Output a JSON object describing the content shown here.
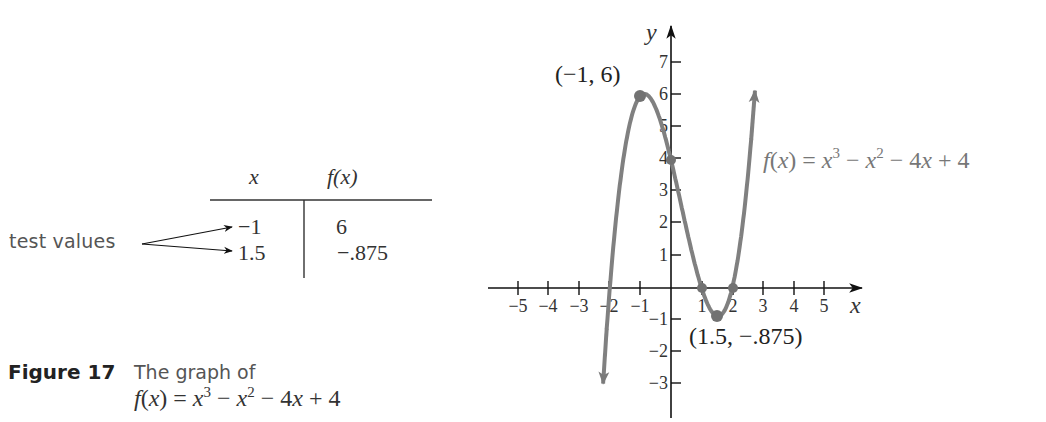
{
  "table": {
    "header_x": "x",
    "header_fx": "f(x)",
    "rows": [
      {
        "x": "−1",
        "fx": "6"
      },
      {
        "x": "1.5",
        "fx": "−.875"
      }
    ],
    "annotation": "test values"
  },
  "caption": {
    "figure_label": "Figure 17",
    "text": "The graph of",
    "equation": "f(x) = x³ − x² − 4x + 4"
  },
  "graph": {
    "function_label": "f(x) = x³ − x² − 4x + 4",
    "point_labels": {
      "max": "(−1, 6)",
      "min": "(1.5, −.875)"
    }
  },
  "chart_data": {
    "type": "line",
    "xlabel": "x",
    "ylabel": "y",
    "xlim": [
      -5.5,
      5.8
    ],
    "ylim": [
      -4,
      7.8
    ],
    "grid": false,
    "x_ticks": [
      -5,
      -4,
      -3,
      -2,
      -1,
      1,
      2,
      3,
      4,
      5
    ],
    "y_ticks": [
      -3,
      -2,
      -1,
      1,
      2,
      3,
      4,
      5,
      6,
      7
    ],
    "x_tick_labels": [
      "−5",
      "−4",
      "−3",
      "−2",
      "−1",
      "1",
      "2",
      "3",
      "4",
      "5"
    ],
    "y_tick_labels": [
      "−3",
      "−2",
      "−1",
      "1",
      "2",
      "3",
      "4",
      "5",
      "6",
      "7"
    ],
    "function": "x^3 - x^2 - 4x + 4",
    "series": [
      {
        "name": "f(x) = x^3 - x^2 - 4x + 4",
        "color": "#808080",
        "x": [
          -2.22,
          -2,
          -1.5,
          -1,
          -0.5,
          0,
          0.5,
          1,
          1.5,
          2,
          2.5,
          2.74
        ],
        "y": [
          -3.9,
          0,
          4.625,
          6,
          5.625,
          4,
          1.875,
          0,
          -0.875,
          0,
          3.375,
          7.5
        ]
      }
    ],
    "highlighted_points": [
      {
        "x": -1,
        "y": 6,
        "label": "(−1, 6)"
      },
      {
        "x": 0,
        "y": 4,
        "label": "y-intercept"
      },
      {
        "x": 1,
        "y": 0,
        "label": "x-intercept"
      },
      {
        "x": 2,
        "y": 0,
        "label": "x-intercept"
      },
      {
        "x": 1.5,
        "y": -0.875,
        "label": "(1.5, −.875)"
      },
      {
        "x": -2,
        "y": 0,
        "label": "x-intercept"
      }
    ],
    "table": {
      "columns": [
        "x",
        "f(x)"
      ],
      "rows": [
        [
          -1,
          6
        ],
        [
          1.5,
          -0.875
        ]
      ]
    },
    "annotations": [
      "test values",
      "(−1, 6)",
      "(1.5, −.875)",
      "f(x) = x³ − x² − 4x + 4"
    ],
    "colors": {
      "curve": "#808080",
      "axes": "#222222",
      "points": "#707070"
    }
  }
}
